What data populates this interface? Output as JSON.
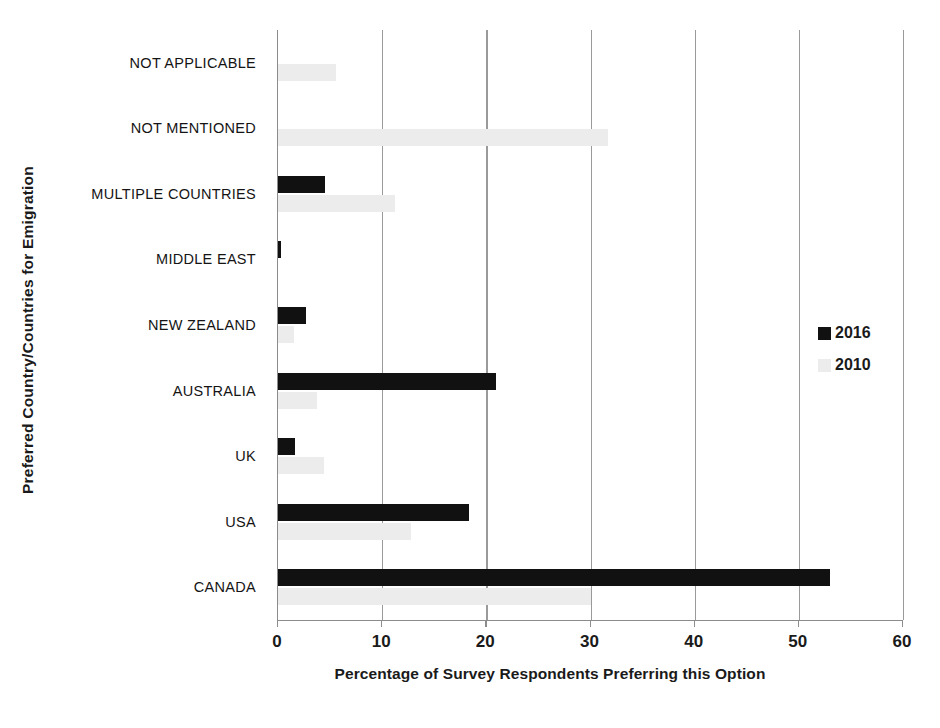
{
  "chart_data": {
    "type": "bar",
    "orientation": "horizontal",
    "title": "",
    "xlabel": "Percentage of Survey Respondents Preferring this Option",
    "ylabel": "Preferred Country/Countries for Emigration",
    "xlim": [
      0,
      60
    ],
    "xticks": [
      0,
      10,
      20,
      30,
      40,
      50,
      60
    ],
    "grid": true,
    "legend_position": "right",
    "categories": [
      "NOT APPLICABLE",
      "NOT MENTIONED",
      "MULTIPLE COUNTRIES",
      "MIDDLE EAST",
      "NEW ZEALAND",
      "AUSTRALIA",
      "UK",
      "USA",
      "CANADA"
    ],
    "series": [
      {
        "name": "2016",
        "color": "#111111",
        "values": [
          0,
          0,
          4.5,
          0.3,
          2.7,
          20.9,
          1.6,
          18.3,
          53.0
        ]
      },
      {
        "name": "2010",
        "color": "#ececec",
        "values": [
          5.6,
          31.7,
          11.2,
          0,
          1.5,
          3.7,
          4.4,
          12.8,
          30.0
        ]
      }
    ]
  },
  "axis": {
    "x_tick_labels": [
      "0",
      "10",
      "20",
      "30",
      "40",
      "50",
      "60"
    ],
    "x_title": "Percentage of Survey Respondents Preferring this Option",
    "y_title": "Preferred Country/Countries for Emigration"
  },
  "legend": {
    "items": [
      {
        "label": "2016",
        "color": "#111111"
      },
      {
        "label": "2010",
        "color": "#ececec"
      }
    ]
  }
}
